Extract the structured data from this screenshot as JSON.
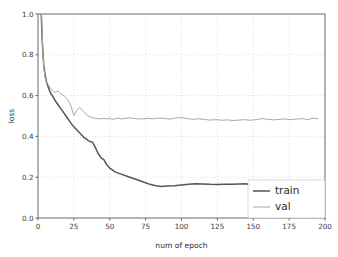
{
  "chart_data": {
    "type": "line",
    "title": "",
    "xlabel": "num of epoch",
    "ylabel": "loss",
    "xlim": [
      0,
      200
    ],
    "ylim": [
      0.0,
      1.0
    ],
    "grid": true,
    "legend_position": "lower right",
    "xticks": [
      0,
      25,
      50,
      75,
      100,
      125,
      150,
      175,
      200
    ],
    "xtick_labels": [
      "0",
      "25",
      "50",
      "75",
      "100",
      "125",
      "150",
      "175",
      "200"
    ],
    "yticks": [
      0.0,
      0.2,
      0.4,
      0.6,
      0.8,
      1.0
    ],
    "ytick_labels": [
      "0.0",
      "0.2",
      "0.4",
      "0.6",
      "0.8",
      "1.0"
    ],
    "series": [
      {
        "name": "train",
        "color": "#555555",
        "width": 1.5,
        "x": [
          1,
          2,
          3,
          4,
          5,
          6,
          7,
          8,
          9,
          10,
          12,
          14,
          16,
          18,
          20,
          22,
          24,
          26,
          28,
          30,
          32,
          34,
          36,
          38,
          40,
          42,
          44,
          46,
          48,
          50,
          54,
          58,
          62,
          66,
          70,
          74,
          78,
          82,
          86,
          90,
          95,
          100,
          105,
          110,
          115,
          120,
          125,
          130,
          135,
          140,
          145,
          148
        ],
        "y": [
          1.32,
          1.05,
          0.86,
          0.75,
          0.7,
          0.665,
          0.645,
          0.625,
          0.61,
          0.6,
          0.575,
          0.555,
          0.535,
          0.515,
          0.495,
          0.475,
          0.455,
          0.44,
          0.425,
          0.41,
          0.395,
          0.385,
          0.375,
          0.372,
          0.345,
          0.315,
          0.295,
          0.285,
          0.26,
          0.245,
          0.225,
          0.215,
          0.205,
          0.195,
          0.185,
          0.175,
          0.165,
          0.158,
          0.155,
          0.157,
          0.158,
          0.162,
          0.165,
          0.168,
          0.167,
          0.165,
          0.164,
          0.165,
          0.166,
          0.167,
          0.168,
          0.163
        ]
      },
      {
        "name": "val",
        "color": "#a8a8a8",
        "width": 1.0,
        "x": [
          1,
          2,
          3,
          4,
          5,
          6,
          7,
          8,
          9,
          10,
          11,
          12,
          13,
          14,
          15,
          16,
          17,
          18,
          19,
          20,
          21,
          22,
          23,
          24,
          25,
          26,
          27,
          28,
          29,
          30,
          31,
          32,
          34,
          36,
          38,
          40,
          42,
          44,
          46,
          48,
          50,
          52,
          54,
          56,
          58,
          60,
          64,
          68,
          72,
          76,
          80,
          84,
          88,
          92,
          96,
          100,
          104,
          108,
          112,
          116,
          120,
          124,
          128,
          132,
          136,
          140,
          144,
          148,
          152,
          156,
          160,
          164,
          168,
          172,
          176,
          180,
          184,
          188,
          192,
          195
        ],
        "y": [
          1.4,
          1.1,
          0.88,
          0.74,
          0.685,
          0.665,
          0.655,
          0.645,
          0.635,
          0.625,
          0.618,
          0.616,
          0.62,
          0.621,
          0.615,
          0.607,
          0.603,
          0.6,
          0.594,
          0.585,
          0.575,
          0.563,
          0.548,
          0.525,
          0.503,
          0.513,
          0.527,
          0.536,
          0.54,
          0.537,
          0.527,
          0.518,
          0.505,
          0.497,
          0.492,
          0.489,
          0.487,
          0.486,
          0.488,
          0.486,
          0.489,
          0.483,
          0.487,
          0.49,
          0.485,
          0.488,
          0.491,
          0.487,
          0.485,
          0.489,
          0.486,
          0.49,
          0.488,
          0.485,
          0.49,
          0.492,
          0.487,
          0.484,
          0.486,
          0.483,
          0.48,
          0.482,
          0.479,
          0.481,
          0.478,
          0.48,
          0.482,
          0.479,
          0.482,
          0.487,
          0.484,
          0.481,
          0.483,
          0.486,
          0.482,
          0.485,
          0.487,
          0.483,
          0.489,
          0.487
        ]
      }
    ]
  },
  "legend": {
    "entries": [
      {
        "label": "train"
      },
      {
        "label": "val"
      }
    ]
  },
  "colors": {
    "train": "#555555",
    "val": "#a8a8a8",
    "axis": "#5a5a5a",
    "grid": "#c9c9d2",
    "background": "#ffffff"
  }
}
